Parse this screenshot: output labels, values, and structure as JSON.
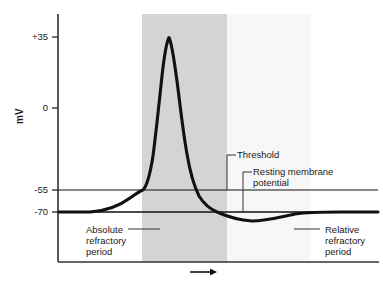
{
  "figure": {
    "kind": "action-potential-diagram",
    "axis_label_y": "mV",
    "time_arrow": "time-arrow"
  },
  "axes": {
    "y_ticks": [
      {
        "label": "+35",
        "value": 35,
        "y_px": 37
      },
      {
        "label": "0",
        "value": 0,
        "y_px": 108
      },
      {
        "label": "-55",
        "value": -55,
        "y_px": 190
      },
      {
        "label": "-70",
        "value": -70,
        "y_px": 212
      }
    ],
    "y_axis_x_px": 58,
    "y_axis_top_px": 14,
    "baseline_y_px": 262,
    "x_axis_right_px": 379
  },
  "reference_lines": [
    {
      "name": "threshold-line",
      "value": -55,
      "y_px": 190,
      "x_start_px": 58,
      "x_end_px": 378
    },
    {
      "name": "resting-potential-line",
      "value": -70,
      "y_px": 212,
      "x_start_px": 58,
      "x_end_px": 378
    }
  ],
  "bands": [
    {
      "name": "absolute-refractory-band",
      "x_start_px": 142,
      "x_end_px": 227,
      "color": "#d4d4d4"
    },
    {
      "name": "relative-refractory-band",
      "x_start_px": 227,
      "x_end_px": 310,
      "color": "#f7f7f7"
    }
  ],
  "annotations": {
    "threshold": {
      "label": "Threshold"
    },
    "resting": {
      "line1": "Resting membrane",
      "line2": "potential"
    },
    "absolute": {
      "line1": "Absolute",
      "line2": "refractory",
      "line3": "period"
    },
    "relative": {
      "line1": "Relative",
      "line2": "refractory",
      "line3": "period"
    }
  },
  "chart_data": {
    "type": "line",
    "title": "",
    "xlabel": "time",
    "ylabel": "mV",
    "ylim": [
      -85,
      45
    ],
    "grid": false,
    "legend": "none",
    "series": [
      {
        "name": "membrane potential",
        "description": "Action potential: resting at -70 mV, slow depolarization to threshold -55 mV, rapid spike to +35 mV peak, repolarization, hyperpolarizing undershoot below -70 mV, return to rest.",
        "points_px": [
          [
            59,
            212
          ],
          [
            75,
            212
          ],
          [
            90,
            212
          ],
          [
            100,
            211
          ],
          [
            110,
            209
          ],
          [
            118,
            206
          ],
          [
            126,
            201
          ],
          [
            133,
            196
          ],
          [
            139,
            191
          ],
          [
            143,
            190
          ],
          [
            147,
            185
          ],
          [
            151,
            171
          ],
          [
            155,
            140
          ],
          [
            159,
            100
          ],
          [
            163,
            62
          ],
          [
            167,
            40
          ],
          [
            169,
            37
          ],
          [
            172,
            41
          ],
          [
            176,
            60
          ],
          [
            180,
            90
          ],
          [
            184,
            125
          ],
          [
            188,
            152
          ],
          [
            192,
            172
          ],
          [
            196,
            186
          ],
          [
            200,
            196
          ],
          [
            205,
            203
          ],
          [
            211,
            208
          ],
          [
            217,
            212
          ],
          [
            223,
            215
          ],
          [
            231,
            218
          ],
          [
            240,
            220
          ],
          [
            252,
            221
          ],
          [
            264,
            221
          ],
          [
            276,
            219
          ],
          [
            288,
            215
          ],
          [
            298,
            213
          ],
          [
            310,
            212
          ],
          [
            330,
            212
          ],
          [
            355,
            212
          ],
          [
            378,
            212
          ]
        ],
        "key_values": {
          "resting_mV": -70,
          "threshold_mV": -55,
          "peak_mV": 35,
          "undershoot_mV": -76
        }
      }
    ]
  },
  "colors": {
    "curve": "#111111",
    "axis": "#333333",
    "band_dark": "#d4d4d4",
    "band_light": "#f7f7f7",
    "text": "#1a1a1a"
  }
}
